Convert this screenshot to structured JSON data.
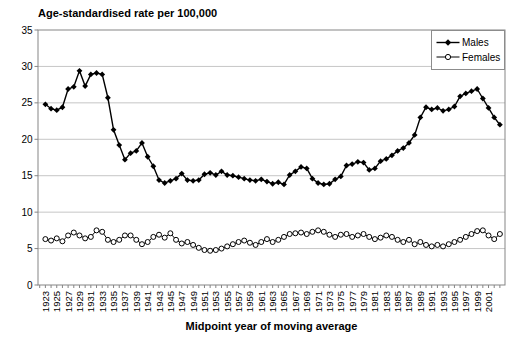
{
  "chart_data": {
    "type": "line",
    "title": "Age-standardised rate per 100,000",
    "xlabel": "Midpoint year of moving average",
    "ylim": [
      0,
      35
    ],
    "yticks": [
      0,
      5,
      10,
      15,
      20,
      25,
      30,
      35
    ],
    "x_start_year": 1923,
    "x_end_year": 2003,
    "x_axis_range": [
      1921.7,
      2003.9
    ],
    "xtick_labels": [
      1923,
      1925,
      1927,
      1929,
      1931,
      1933,
      1935,
      1937,
      1939,
      1941,
      1943,
      1945,
      1947,
      1949,
      1951,
      1953,
      1955,
      1957,
      1959,
      1961,
      1963,
      1965,
      1967,
      1969,
      1971,
      1973,
      1975,
      1977,
      1979,
      1981,
      1983,
      1985,
      1987,
      1989,
      1991,
      1993,
      1995,
      1997,
      1999,
      2001
    ],
    "grid": "horizontal",
    "legend_position": "top-right",
    "series": [
      {
        "name": "Males",
        "marker": "filled-diamond",
        "color": "#000000",
        "values": [
          24.8,
          24.2,
          24.0,
          24.4,
          26.9,
          27.2,
          29.4,
          27.3,
          28.9,
          29.1,
          28.9,
          25.7,
          21.3,
          19.2,
          17.2,
          18.1,
          18.4,
          19.5,
          17.6,
          16.3,
          14.4,
          14.0,
          14.3,
          14.6,
          15.3,
          14.4,
          14.3,
          14.4,
          15.2,
          15.4,
          15.1,
          15.6,
          15.1,
          15.0,
          14.8,
          14.6,
          14.4,
          14.3,
          14.5,
          14.2,
          13.9,
          14.1,
          13.8,
          15.1,
          15.6,
          16.2,
          16.0,
          14.6,
          14.0,
          13.8,
          13.9,
          14.5,
          14.9,
          16.4,
          16.6,
          16.9,
          16.8,
          15.8,
          16.0,
          17.0,
          17.3,
          17.8,
          18.4,
          18.8,
          19.5,
          20.6,
          23.0,
          24.4,
          24.1,
          24.3,
          23.9,
          24.1,
          24.5,
          25.9,
          26.3,
          26.6,
          26.9,
          25.6,
          24.3,
          23.0,
          22.0
        ]
      },
      {
        "name": "Females",
        "marker": "open-circle",
        "color": "#000000",
        "values": [
          6.3,
          6.1,
          6.4,
          6.0,
          6.8,
          7.2,
          6.8,
          6.4,
          6.6,
          7.5,
          7.3,
          6.2,
          5.9,
          6.2,
          6.8,
          6.8,
          6.2,
          5.6,
          5.9,
          6.6,
          6.9,
          6.5,
          7.1,
          6.2,
          5.7,
          5.9,
          5.5,
          5.1,
          4.8,
          4.7,
          4.8,
          5.0,
          5.3,
          5.6,
          5.9,
          6.1,
          5.8,
          5.5,
          5.9,
          6.3,
          5.9,
          6.2,
          6.6,
          7.0,
          7.1,
          7.2,
          7.0,
          7.3,
          7.5,
          7.3,
          6.9,
          6.6,
          6.9,
          7.0,
          6.6,
          6.8,
          7.0,
          6.6,
          6.3,
          6.5,
          6.8,
          6.6,
          6.2,
          5.9,
          6.2,
          5.6,
          5.9,
          5.5,
          5.3,
          5.5,
          5.3,
          5.6,
          5.9,
          6.2,
          6.6,
          7.0,
          7.4,
          7.5,
          6.8,
          6.3,
          7.0
        ]
      }
    ],
    "colors": {
      "background": "#ffffff",
      "gridline": "#c6c6c6",
      "axis": "#858585",
      "text": "#000000"
    }
  }
}
